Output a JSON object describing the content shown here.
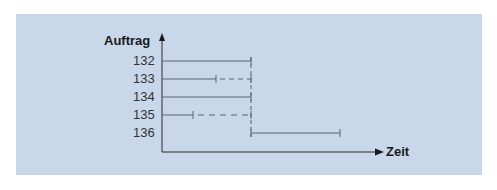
{
  "diagram": {
    "y_axis_label": "Auftrag",
    "x_axis_label": "Zeit",
    "rows": [
      {
        "label": "132",
        "solid_end": 251,
        "dashed_end": 251
      },
      {
        "label": "133",
        "solid_end": 216,
        "dashed_end": 251
      },
      {
        "label": "134",
        "solid_end": 251,
        "dashed_end": 251
      },
      {
        "label": "135",
        "solid_end": 193,
        "dashed_end": 251
      },
      {
        "label": "136",
        "start": 251,
        "solid_end": 340
      }
    ],
    "colors": {
      "panel": "#c8d7ea",
      "line": "#5a6570",
      "axis": "#2a2a2a"
    }
  }
}
